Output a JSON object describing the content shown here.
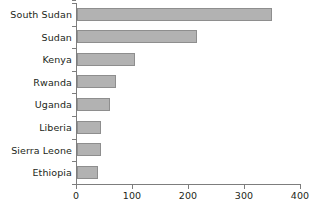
{
  "chart_data": {
    "type": "bar",
    "orientation": "horizontal",
    "title": "",
    "subtitle": "",
    "xlabel": "",
    "ylabel": "",
    "categories": [
      "South Sudan",
      "Sudan",
      "Kenya",
      "Rwanda",
      "Uganda",
      "Liberia",
      "Sierra Leone",
      "Ethiopia"
    ],
    "values": [
      348,
      215,
      103,
      70,
      59,
      42,
      42,
      38
    ],
    "series": [
      {
        "name": "",
        "values": [
          348,
          215,
          103,
          70,
          59,
          42,
          42,
          38
        ]
      }
    ],
    "xlim": [
      0,
      400
    ],
    "xticks": [
      0,
      100,
      200,
      300,
      400
    ],
    "xtick_labels": [
      "0",
      "100",
      "200",
      "300",
      "400"
    ],
    "grid": false,
    "legend": false,
    "legend_position": "none",
    "bar_color": "#b2b2b2",
    "bar_edge_color": "#8e8e8e",
    "axis_color": "#7d7d7d",
    "text_color": "#231f20",
    "background_color": "#ffffff",
    "annotations": []
  }
}
